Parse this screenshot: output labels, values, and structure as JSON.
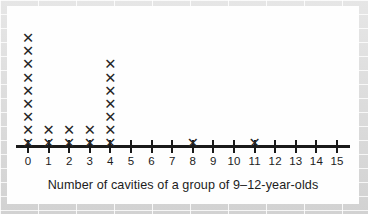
{
  "chart_data": {
    "type": "scatter",
    "plot_style": "dot-plot",
    "title": "",
    "caption": "Number of cavities of a group of 9–12-year-olds",
    "xlabel": "Number of cavities of a group of 9–12-year-olds",
    "ylabel": "",
    "mark_glyph": "✕",
    "mark_color": "#262626",
    "axis_color": "#1a1a1a",
    "background_color": "#fefefe",
    "grid": false,
    "legend": null,
    "xlim": [
      0,
      15
    ],
    "categories": [
      0,
      1,
      2,
      3,
      4,
      5,
      6,
      7,
      8,
      9,
      10,
      11,
      12,
      13,
      14,
      15
    ],
    "tick_labels": [
      "0",
      "1",
      "2",
      "3",
      "4",
      "5",
      "6",
      "7",
      "8",
      "9",
      "10",
      "11",
      "12",
      "13",
      "14",
      "15"
    ],
    "values": [
      9,
      2,
      2,
      2,
      7,
      0,
      0,
      0,
      1,
      0,
      0,
      1,
      0,
      0,
      0,
      0
    ],
    "total_count": 24,
    "max_stack": 9
  },
  "figure": {
    "caption": "Number of cavities of a group of 9–12-year-olds"
  }
}
